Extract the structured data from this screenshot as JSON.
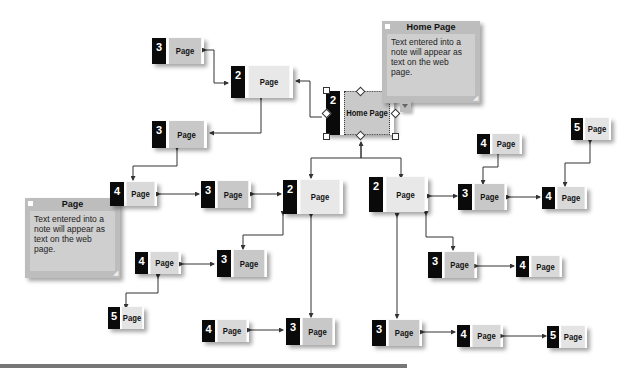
{
  "diagram": {
    "type": "site-map",
    "level_colors": {
      "1": "#c9c9c9",
      "2": "#e8e8e8",
      "3": "#c8c8c8",
      "4": "#d9d9d9",
      "5": "#e4e4e4"
    },
    "number_color": "#0a0a0a",
    "connector_color": "#333333"
  },
  "nodes": [
    {
      "id": "home",
      "level": "2",
      "label": "Home Page",
      "selected": true
    },
    {
      "id": "a2",
      "level": "2",
      "label": "Page"
    },
    {
      "id": "a3",
      "level": "3",
      "label": "Page"
    },
    {
      "id": "b3",
      "level": "3",
      "label": "Page"
    },
    {
      "id": "c4",
      "level": "4",
      "label": "Page"
    },
    {
      "id": "c3",
      "level": "3",
      "label": "Page"
    },
    {
      "id": "m2",
      "level": "2",
      "label": "Page"
    },
    {
      "id": "r2",
      "level": "2",
      "label": "Page"
    },
    {
      "id": "r3",
      "level": "3",
      "label": "Page"
    },
    {
      "id": "r4top",
      "level": "4",
      "label": "Page"
    },
    {
      "id": "r4",
      "level": "4",
      "label": "Page"
    },
    {
      "id": "r5",
      "level": "5",
      "label": "Page"
    },
    {
      "id": "m3",
      "level": "3",
      "label": "Page"
    },
    {
      "id": "l4",
      "level": "4",
      "label": "Page"
    },
    {
      "id": "l5",
      "level": "5",
      "label": "Page"
    },
    {
      "id": "bl4",
      "level": "4",
      "label": "Page"
    },
    {
      "id": "bl3",
      "level": "3",
      "label": "Page"
    },
    {
      "id": "rm3",
      "level": "3",
      "label": "Page"
    },
    {
      "id": "rm4",
      "level": "4",
      "label": "Page"
    },
    {
      "id": "br3",
      "level": "3",
      "label": "Page"
    },
    {
      "id": "br4",
      "level": "4",
      "label": "Page"
    },
    {
      "id": "br5",
      "level": "5",
      "label": "Page"
    }
  ],
  "notes": [
    {
      "title": "Home Page",
      "text": "Text entered into a note will appear as text on the web page."
    },
    {
      "title": "Page",
      "text": "Text entered into a note will appear as text on the web page."
    }
  ]
}
